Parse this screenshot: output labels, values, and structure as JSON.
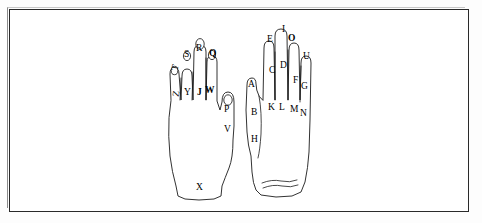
{
  "figure": {
    "background_color": "#ffffff",
    "ink_color": "#1b1b1b",
    "frame": {
      "present": true,
      "style": "thin black rectangle border"
    }
  },
  "left_hand": {
    "name": "left-hand-outline",
    "orientation": "fingers up, thumb on right side",
    "fingernails": 5,
    "labels": [
      {
        "id": "T",
        "text": "T",
        "x": 176,
        "y": 68,
        "bold": false,
        "rotated": true
      },
      {
        "id": "S",
        "text": "S",
        "x": 186,
        "y": 55,
        "bold": false,
        "rotated": false
      },
      {
        "id": "R",
        "text": "R",
        "x": 199,
        "y": 49,
        "bold": false,
        "rotated": false
      },
      {
        "id": "Q",
        "text": "Q",
        "x": 212,
        "y": 54,
        "bold": true,
        "rotated": false
      },
      {
        "id": "Z",
        "text": "Z",
        "x": 177,
        "y": 94,
        "bold": false,
        "rotated": true
      },
      {
        "id": "Y",
        "text": "Y",
        "x": 187,
        "y": 93,
        "bold": false,
        "rotated": false
      },
      {
        "id": "J",
        "text": "J",
        "x": 199,
        "y": 93,
        "bold": true,
        "rotated": false
      },
      {
        "id": "W",
        "text": "W",
        "x": 209,
        "y": 91,
        "bold": true,
        "rotated": false
      },
      {
        "id": "P",
        "text": "P",
        "x": 226,
        "y": 110,
        "bold": false,
        "rotated": false
      },
      {
        "id": "V",
        "text": "V",
        "x": 226,
        "y": 130,
        "bold": false,
        "rotated": false
      },
      {
        "id": "X",
        "text": "X",
        "x": 198,
        "y": 188,
        "bold": false,
        "rotated": false
      }
    ]
  },
  "right_hand": {
    "name": "right-hand-outline",
    "orientation": "fingers up, thumb on left side",
    "fingernails": 0,
    "wrist_creases": 2,
    "labels": [
      {
        "id": "E",
        "text": "E",
        "x": 269,
        "y": 40,
        "bold": false,
        "rotated": false
      },
      {
        "id": "I",
        "text": "I",
        "x": 283,
        "y": 30,
        "bold": false,
        "rotated": false
      },
      {
        "id": "O",
        "text": "O",
        "x": 291,
        "y": 39,
        "bold": true,
        "rotated": false
      },
      {
        "id": "U",
        "text": "U",
        "x": 305,
        "y": 57,
        "bold": false,
        "rotated": false
      },
      {
        "id": "C",
        "text": "C",
        "x": 271,
        "y": 71,
        "bold": false,
        "rotated": false
      },
      {
        "id": "D",
        "text": "D",
        "x": 282,
        "y": 66,
        "bold": false,
        "rotated": false
      },
      {
        "id": "F",
        "text": "F",
        "x": 294,
        "y": 81,
        "bold": false,
        "rotated": false
      },
      {
        "id": "G",
        "text": "G",
        "x": 303,
        "y": 87,
        "bold": false,
        "rotated": false
      },
      {
        "id": "A",
        "text": "A",
        "x": 250,
        "y": 85,
        "bold": false,
        "rotated": false
      },
      {
        "id": "K",
        "text": "K",
        "x": 270,
        "y": 108,
        "bold": false,
        "rotated": false
      },
      {
        "id": "L",
        "text": "L",
        "x": 281,
        "y": 108,
        "bold": false,
        "rotated": false
      },
      {
        "id": "M",
        "text": "M",
        "x": 292,
        "y": 110,
        "bold": false,
        "rotated": false
      },
      {
        "id": "N",
        "text": "N",
        "x": 302,
        "y": 114,
        "bold": false,
        "rotated": false
      },
      {
        "id": "B",
        "text": "B",
        "x": 253,
        "y": 113,
        "bold": false,
        "rotated": false
      },
      {
        "id": "H",
        "text": "H",
        "x": 253,
        "y": 140,
        "bold": false,
        "rotated": false
      }
    ]
  }
}
